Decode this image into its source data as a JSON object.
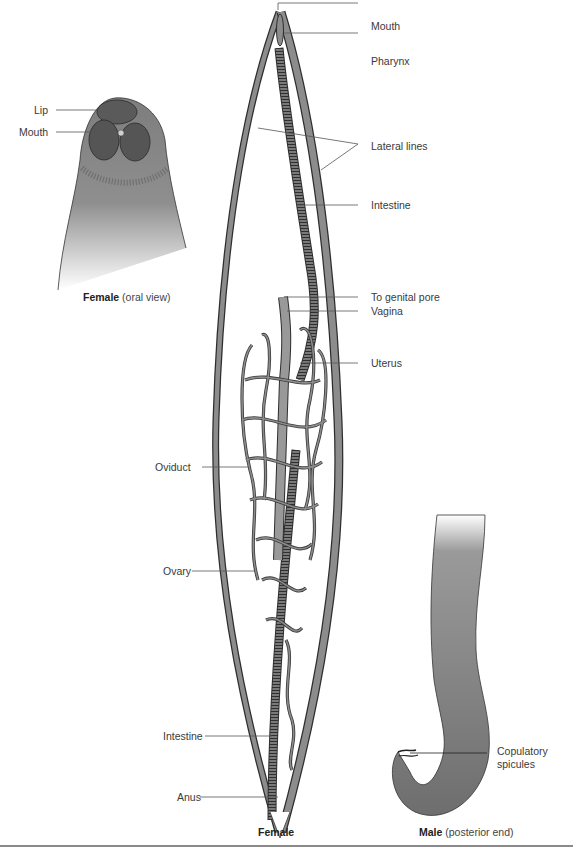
{
  "figure": {
    "panels": [
      {
        "id": "female-oral",
        "caption_bold": "Female",
        "caption_rest": "(oral view)",
        "labels": [
          {
            "text": "Lip"
          },
          {
            "text": "Mouth"
          }
        ]
      },
      {
        "id": "female",
        "caption_bold": "Female",
        "caption_rest": "",
        "labels": [
          {
            "text": "Mouth"
          },
          {
            "text": "Pharynx"
          },
          {
            "text": "Lateral lines"
          },
          {
            "text": "Intestine"
          },
          {
            "text": "To genital pore"
          },
          {
            "text": "Vagina"
          },
          {
            "text": "Uterus"
          },
          {
            "text": "Oviduct"
          },
          {
            "text": "Ovary"
          },
          {
            "text": "Intestine"
          },
          {
            "text": "Anus"
          }
        ]
      },
      {
        "id": "male-posterior",
        "caption_bold": "Male",
        "caption_rest": "(posterior end)",
        "labels": [
          {
            "text": "Copulatory"
          },
          {
            "text": "spicules"
          }
        ]
      }
    ],
    "colors": {
      "body_fill": "#8c8c8c",
      "body_dark": "#4a4a4a",
      "outline": "#2e2e2e",
      "leader": "#555555",
      "text": "#3a3a3a",
      "rule": "#8a8a8a"
    }
  }
}
